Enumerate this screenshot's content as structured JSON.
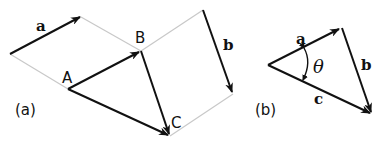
{
  "figure": {
    "panel_a": {
      "caption": "(a)",
      "points": {
        "A": "A",
        "B": "B",
        "C": "C"
      },
      "vector_labels": {
        "a": "a",
        "b": "b"
      }
    },
    "panel_b": {
      "caption": "(b)",
      "vector_labels": {
        "a": "a",
        "b": "b",
        "c": "c"
      },
      "angle_label": "θ"
    }
  },
  "colors": {
    "vector": "#111111",
    "guide": "#c8c8c8"
  }
}
